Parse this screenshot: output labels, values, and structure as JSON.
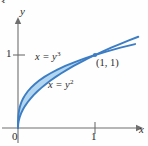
{
  "figure": {
    "number_fragment": "3.",
    "background_color": "#fefefe",
    "axis_color": "#6e6e6e",
    "curve_color": "#3c7dc4",
    "fill_color": "#aed4ee",
    "text_color": "#2a2a2a"
  },
  "axes": {
    "x_label": "x",
    "y_label": "y",
    "origin_label": "0",
    "x_ticks": [
      {
        "label": "1",
        "value": 1
      }
    ],
    "y_ticks": [
      {
        "label": "1",
        "value": 1
      }
    ],
    "x_range": [
      -0.12,
      1.55
    ],
    "y_range": [
      -0.18,
      1.45
    ]
  },
  "annotations": {
    "upper_curve_label": {
      "lhs": "x",
      "eq": "=",
      "base": "y",
      "exponent": "3"
    },
    "lower_curve_label": {
      "lhs": "x",
      "eq": "=",
      "base": "y",
      "exponent": "2"
    },
    "intersection_point_label": "(1, 1)"
  },
  "chart_data": {
    "type": "line",
    "title": "",
    "xlabel": "x",
    "ylabel": "y",
    "xlim": [
      -0.12,
      1.55
    ],
    "ylim": [
      -0.18,
      1.45
    ],
    "grid": false,
    "legend": "inline-annotations",
    "shaded_region": {
      "description": "Region between x = y^3 and x = y^2 for 0 <= y <= 1",
      "between": [
        "x = y^3",
        "x = y^2"
      ],
      "y_from": 0,
      "y_to": 1,
      "fill": "#aed4ee"
    },
    "intersections": [
      {
        "x": 0,
        "y": 0,
        "label": "0"
      },
      {
        "x": 1,
        "y": 1,
        "label": "(1, 1)"
      }
    ],
    "series": [
      {
        "name": "x = y^3",
        "equation": "x = y^3",
        "color": "#3c7dc4",
        "points": [
          [
            0.0,
            0.0
          ],
          [
            0.000125,
            0.05
          ],
          [
            0.001,
            0.1
          ],
          [
            0.003375,
            0.15
          ],
          [
            0.008,
            0.2
          ],
          [
            0.015625,
            0.25
          ],
          [
            0.027,
            0.3
          ],
          [
            0.042875,
            0.35
          ],
          [
            0.064,
            0.4
          ],
          [
            0.091125,
            0.45
          ],
          [
            0.125,
            0.5
          ],
          [
            0.166375,
            0.55
          ],
          [
            0.216,
            0.6
          ],
          [
            0.274625,
            0.65
          ],
          [
            0.343,
            0.7
          ],
          [
            0.421875,
            0.75
          ],
          [
            0.512,
            0.8
          ],
          [
            0.614125,
            0.85
          ],
          [
            0.729,
            0.9
          ],
          [
            0.857375,
            0.95
          ],
          [
            1.0,
            1.0
          ],
          [
            1.157625,
            1.05
          ],
          [
            1.331,
            1.1
          ],
          [
            1.520875,
            1.15
          ]
        ]
      },
      {
        "name": "x = y^2",
        "equation": "x = y^2",
        "color": "#3c7dc4",
        "points": [
          [
            0.0,
            0.0
          ],
          [
            0.0025,
            0.05
          ],
          [
            0.01,
            0.1
          ],
          [
            0.0225,
            0.15
          ],
          [
            0.04,
            0.2
          ],
          [
            0.0625,
            0.25
          ],
          [
            0.09,
            0.3
          ],
          [
            0.1225,
            0.35
          ],
          [
            0.16,
            0.4
          ],
          [
            0.2025,
            0.45
          ],
          [
            0.25,
            0.5
          ],
          [
            0.3025,
            0.55
          ],
          [
            0.36,
            0.6
          ],
          [
            0.4225,
            0.65
          ],
          [
            0.49,
            0.7
          ],
          [
            0.5625,
            0.75
          ],
          [
            0.64,
            0.8
          ],
          [
            0.7225,
            0.85
          ],
          [
            0.81,
            0.9
          ],
          [
            0.9025,
            0.95
          ],
          [
            1.0,
            1.0
          ],
          [
            1.1025,
            1.05
          ],
          [
            1.21,
            1.1
          ],
          [
            1.3225,
            1.15
          ],
          [
            1.44,
            1.2
          ],
          [
            1.5625,
            1.25
          ]
        ]
      }
    ]
  }
}
